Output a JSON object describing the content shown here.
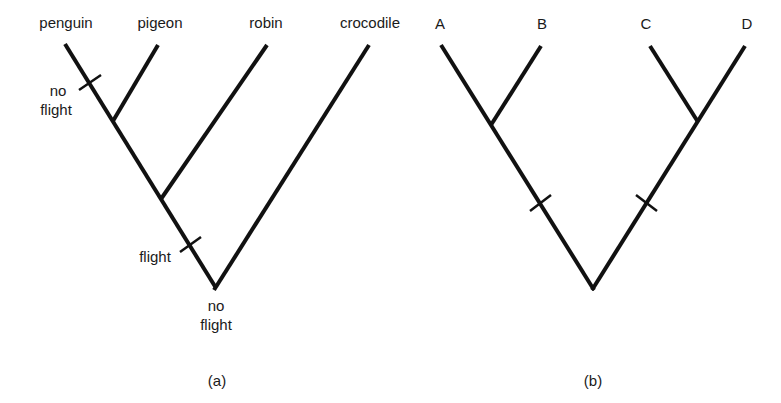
{
  "figure": {
    "panel_a": {
      "caption": "(a)",
      "taxa": [
        "penguin",
        "pigeon",
        "robin",
        "crocodile"
      ],
      "labels": {
        "no_flight_tick_line1": "no",
        "no_flight_tick_line2": "flight",
        "flight_tick": "flight",
        "root_line1": "no",
        "root_line2": "flight"
      }
    },
    "panel_b": {
      "caption": "(b)",
      "taxa": [
        "A",
        "B",
        "C",
        "D"
      ]
    }
  }
}
